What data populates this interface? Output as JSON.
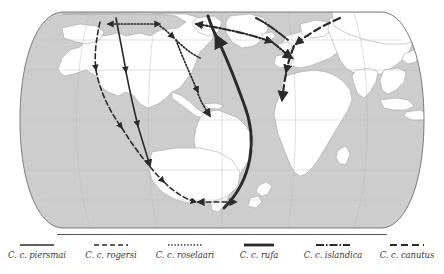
{
  "figure": {
    "type": "world-migration-flyway-map",
    "projection": "robinson",
    "colors": {
      "ocean": "#cdcdcd",
      "land": "#ffffff",
      "coastline": "#8c8c8c",
      "graticule": "#b9b9b9",
      "frame": "#6e6e6e",
      "route": "#2b2b2b",
      "legend_text": "#3a3a3a",
      "legend_rule": "#5a5a5a",
      "background": "#ffffff"
    }
  },
  "legend": {
    "items": [
      {
        "label": "C. c. piersmai",
        "style": "solid-thin",
        "dash": "none",
        "width": 1.6
      },
      {
        "label": "C. c. rogersi",
        "style": "dashed",
        "dash": "5,3",
        "width": 1.6
      },
      {
        "label": "C. c. roselaari",
        "style": "dotted",
        "dash": "1.4,1.8",
        "width": 1.6
      },
      {
        "label": "C. c. rufa",
        "style": "solid-thick",
        "dash": "none",
        "width": 2.8
      },
      {
        "label": "C. c. islandica",
        "style": "dash-dot",
        "dash": "8,2,1.5,2",
        "width": 2.0
      },
      {
        "label": "C. c. canutus",
        "style": "long-dash",
        "dash": "7,4",
        "width": 2.2
      }
    ]
  },
  "routes": [
    {
      "name": "piersmai-flyway",
      "subspecies": "C. c. piersmai",
      "style": "solid-thin",
      "description": "New Siberian Islands to northwest Australia via East Asia"
    },
    {
      "name": "rogersi-flyway",
      "subspecies": "C. c. rogersi",
      "style": "dashed",
      "description": "Chukotka to southeast Australia and New Zealand via East Asia"
    },
    {
      "name": "roselaari-flyway",
      "subspecies": "C. c. roselaari",
      "style": "dotted",
      "description": "Wrangel Island and Alaska to Pacific and Gulf coasts of the Americas"
    },
    {
      "name": "rufa-flyway",
      "subspecies": "C. c. rufa",
      "style": "solid-thick",
      "description": "Canadian Arctic to Tierra del Fuego, South America"
    },
    {
      "name": "islandica-flyway",
      "subspecies": "C. c. islandica",
      "style": "dash-dot",
      "description": "Canadian High Arctic and Greenland to western Europe via Iceland"
    },
    {
      "name": "canutus-flyway",
      "subspecies": "C. c. canutus",
      "style": "long-dash",
      "description": "Taimyr Peninsula to West Africa via the Wadden Sea"
    }
  ]
}
